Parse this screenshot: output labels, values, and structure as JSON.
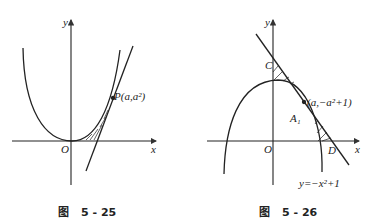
{
  "figures": [
    {
      "id": "fig-5-25",
      "caption": {
        "prefix": "图",
        "number": "5 - 25"
      },
      "labels": {
        "y": "y",
        "x": "x",
        "origin": "O",
        "point": "P(a,a²)"
      }
    },
    {
      "id": "fig-5-26",
      "caption": {
        "prefix": "图",
        "number": "5 - 26"
      },
      "labels": {
        "y": "y",
        "x": "x",
        "origin": "O",
        "c": "C",
        "d": "D",
        "point": "(a,−a²+1)",
        "region": "A₁",
        "curve": "y=−x²+1"
      }
    }
  ]
}
